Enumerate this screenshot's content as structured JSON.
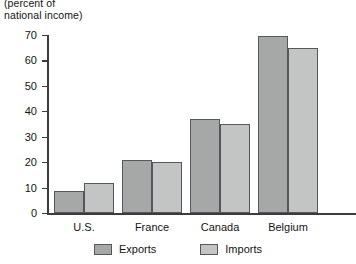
{
  "chart_data": {
    "type": "bar",
    "title": "",
    "subtitle": "",
    "axis_caption_line1": "(percent of",
    "axis_caption_line2": "national income)",
    "categories": [
      "U.S.",
      "France",
      "Canada",
      "Belgium"
    ],
    "series": [
      {
        "name": "Exports",
        "color": "#a6a8a8",
        "values": [
          8.5,
          21,
          37,
          69.5
        ]
      },
      {
        "name": "Imports",
        "color": "#c3c5c4",
        "values": [
          12,
          20,
          35,
          65
        ]
      }
    ],
    "xlabel": "",
    "ylabel": "",
    "ylim": [
      0,
      70
    ],
    "ytick_step": 10,
    "yticks": [
      "0",
      "10",
      "20",
      "30",
      "40",
      "50",
      "60",
      "70"
    ],
    "grid": false,
    "legend_position": "bottom-center",
    "legend_entries": [
      "Exports",
      "Imports"
    ],
    "axis_color": "#3c3c3c",
    "bar_border_color": "#55575a",
    "background": "#ffffff"
  }
}
